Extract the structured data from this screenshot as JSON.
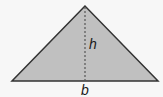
{
  "diagram": {
    "shape": "isosceles-triangle",
    "fill_color": "#c0c0c0",
    "stroke_color": "#333333",
    "background_color": "#f7f7f7",
    "vertices": {
      "apex": [
        85,
        6
      ],
      "base_left": [
        12,
        81
      ],
      "base_right": [
        158,
        81
      ]
    },
    "height_line": {
      "style": "dashed",
      "from": [
        85,
        6
      ],
      "to": [
        85,
        81
      ]
    },
    "labels": {
      "height": "h",
      "base": "b"
    }
  }
}
